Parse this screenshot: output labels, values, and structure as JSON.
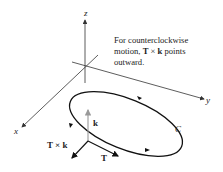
{
  "axes": {
    "x_label": "x",
    "y_label": "y",
    "z_label": "z"
  },
  "curve_label": "C",
  "vectors": {
    "k": "k",
    "T": "T",
    "TxK": "T × k"
  },
  "note": {
    "line1": "For counterclockwise",
    "line2_pre": "motion, ",
    "line2_T": "T",
    "line2_times": " × ",
    "line2_k": "k",
    "line2_post": " points",
    "line3": "outward."
  },
  "colors": {
    "axis": "#333333",
    "curve": "#111111",
    "k_vector": "#999999"
  }
}
